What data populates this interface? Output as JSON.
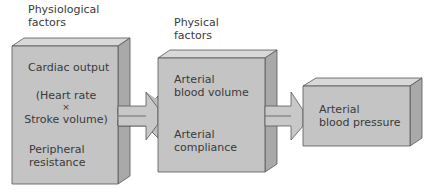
{
  "colors": {
    "front": "#c4c4c4",
    "top": "#d8d8d8",
    "side": "#a9a9a9",
    "edge": "#555555",
    "text": "#3a3a3a"
  },
  "header_left": [
    "Physiological",
    "factors"
  ],
  "header_mid": [
    "Physical",
    "factors"
  ],
  "box1": {
    "cardiac_output": "Cardiac output",
    "formula": [
      "(Heart rate",
      "×",
      "Stroke volume)"
    ],
    "peripheral": [
      "Peripheral",
      "resistance"
    ]
  },
  "box2": {
    "volume": [
      "Arterial",
      "blood volume"
    ],
    "compliance": [
      "Arterial",
      "compliance"
    ]
  },
  "box3": {
    "pressure": [
      "Arterial",
      "blood pressure"
    ]
  }
}
